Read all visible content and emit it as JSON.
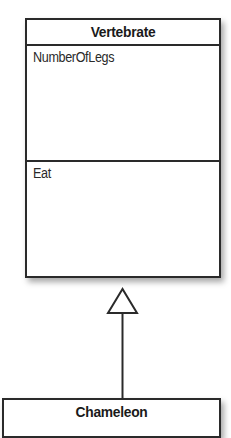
{
  "diagram": {
    "type": "uml-class-inheritance",
    "classes": [
      {
        "name": "Vertebrate",
        "attributes": [
          "NumberOfLegs"
        ],
        "operations": [
          "Eat"
        ]
      },
      {
        "name": "Chameleon",
        "attributes": [],
        "operations": []
      }
    ],
    "relationships": [
      {
        "kind": "generalization",
        "from": "Chameleon",
        "to": "Vertebrate",
        "arrowhead": "hollow-triangle"
      }
    ],
    "colors": {
      "stroke": "#2a2a2a",
      "fill": "#ffffff",
      "text": "#1a1a1a"
    }
  }
}
